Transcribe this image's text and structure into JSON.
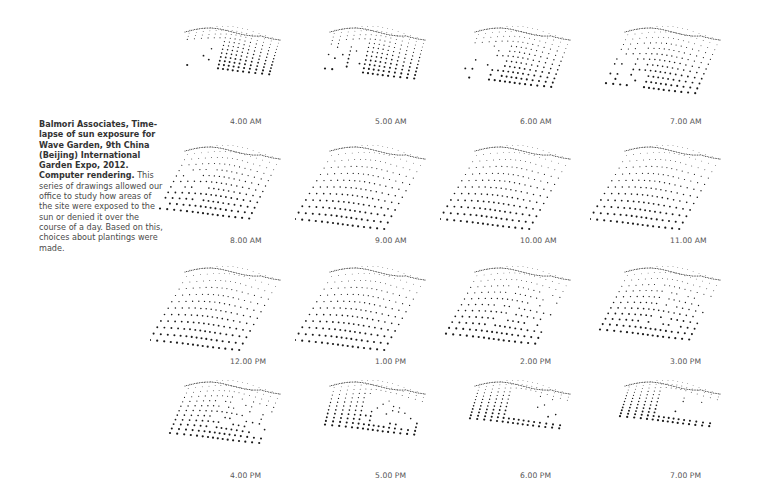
{
  "caption": {
    "title": "Balmori Associates, Time-lapse of sun exposure for Wave Garden, 9th China (Beijing) International Garden Expo, 2012. Computer rendering.",
    "body": "This series of drawings allowed our office to study how areas of the site were exposed to the sun or denied it over the course of a day.  Based on this, choices about plantings were made."
  },
  "panels": [
    {
      "label": "4.00 AM",
      "exposure": 0.15,
      "shadow": "right"
    },
    {
      "label": "5.00 AM",
      "exposure": 0.25,
      "shadow": "right"
    },
    {
      "label": "6.00 AM",
      "exposure": 0.45,
      "shadow": "right"
    },
    {
      "label": "7.00 AM",
      "exposure": 0.6,
      "shadow": "right"
    },
    {
      "label": "8.00 AM",
      "exposure": 0.75,
      "shadow": "right"
    },
    {
      "label": "9.00 AM",
      "exposure": 1.0,
      "shadow": "none"
    },
    {
      "label": "10.00 AM",
      "exposure": 1.0,
      "shadow": "none"
    },
    {
      "label": "11.00 AM",
      "exposure": 1.0,
      "shadow": "none"
    },
    {
      "label": "12.00 PM",
      "exposure": 1.0,
      "shadow": "none"
    },
    {
      "label": "1.00 PM",
      "exposure": 1.0,
      "shadow": "none"
    },
    {
      "label": "2.00 PM",
      "exposure": 0.85,
      "shadow": "left"
    },
    {
      "label": "3.00 PM",
      "exposure": 0.75,
      "shadow": "left"
    },
    {
      "label": "4.00 PM",
      "exposure": 0.5,
      "shadow": "left"
    },
    {
      "label": "5.00 PM",
      "exposure": 0.3,
      "shadow": "left"
    },
    {
      "label": "6.00 PM",
      "exposure": 0.15,
      "shadow": "left"
    },
    {
      "label": "7.00 PM",
      "exposure": 0.1,
      "shadow": "left"
    }
  ],
  "colors": {
    "dot": "#1a1a1a",
    "label": "#555555",
    "caption": "#3a3a3a"
  }
}
